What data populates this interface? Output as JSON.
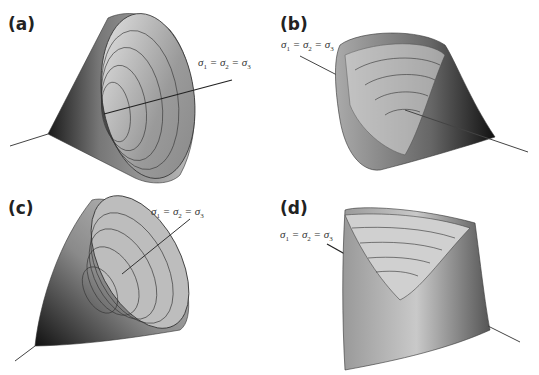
{
  "figure": {
    "panels": [
      {
        "label": "(a)",
        "equation": {
          "s1": "σ",
          "i1": "1",
          "s2": "σ",
          "i2": "2",
          "s3": "σ",
          "i3": "3",
          "eq": "="
        },
        "shape": "circular cone (Drucker–Prager type yield surface)"
      },
      {
        "label": "(b)",
        "equation": {
          "s1": "σ",
          "i1": "1",
          "s2": "σ",
          "i2": "2",
          "s3": "σ",
          "i3": "3",
          "eq": "="
        },
        "shape": "rounded-triangular cone"
      },
      {
        "label": "(c)",
        "equation": {
          "s1": "σ",
          "i1": "1",
          "s2": "σ",
          "i2": "2",
          "s3": "σ",
          "i3": "3",
          "eq": "="
        },
        "shape": "paraboloid-like cone"
      },
      {
        "label": "(d)",
        "equation": {
          "s1": "σ",
          "i1": "1",
          "s2": "σ",
          "i2": "2",
          "s3": "σ",
          "i3": "3",
          "eq": "="
        },
        "shape": "hexagonal-like cone with curved faces"
      }
    ],
    "axis_label": "σ1 = σ2 = σ3"
  }
}
